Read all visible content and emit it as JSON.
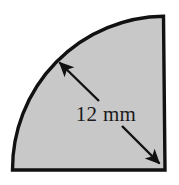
{
  "figure": {
    "name": "quarter-circle-radius-diagram",
    "shape_type": "quarter-circle-sector",
    "background_color": "#ffffff",
    "fill_color": "#c8c8c8",
    "stroke_color": "#111111",
    "stroke_width": 3,
    "dimension_label": {
      "text": "12 mm",
      "value": "12",
      "unit": "mm",
      "measures": "radius"
    },
    "geometry": {
      "center_point": "bottom-right",
      "radius_px": 153,
      "arc_start": "bottom-left",
      "arc_end": "top-right",
      "sweep_degrees": 90
    },
    "arrows": [
      {
        "name": "radius-arrow-to-arc",
        "direction": "up-left",
        "points_to": "arc"
      },
      {
        "name": "radius-arrow-to-center",
        "direction": "down-right",
        "points_to": "corner-vertex"
      }
    ]
  }
}
